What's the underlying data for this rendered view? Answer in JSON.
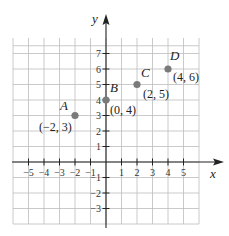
{
  "chart_data": {
    "type": "scatter",
    "title": "",
    "xlabel": "x",
    "ylabel": "y",
    "xlim": [
      -6,
      6
    ],
    "ylim": [
      -4,
      8
    ],
    "grid": true,
    "x_ticks": [
      -5,
      -4,
      -3,
      -2,
      -1,
      1,
      2,
      3,
      4,
      5
    ],
    "y_ticks": [
      -3,
      -2,
      -1,
      1,
      2,
      3,
      4,
      5,
      6,
      7
    ],
    "x_tick_labels": [
      "−5",
      "−4",
      "−3",
      "−2",
      "−1",
      "1",
      "2",
      "3",
      "4",
      "5"
    ],
    "y_tick_labels": [
      "−3",
      "−2",
      "−1",
      "1",
      "2",
      "3",
      "4",
      "5",
      "6",
      "7"
    ],
    "points": [
      {
        "name": "A",
        "x": -2,
        "y": 3,
        "label": "(−2, 3)"
      },
      {
        "name": "B",
        "x": 0,
        "y": 4,
        "label": "(0, 4)"
      },
      {
        "name": "C",
        "x": 2,
        "y": 5,
        "label": "(2, 5)"
      },
      {
        "name": "D",
        "x": 4,
        "y": 6,
        "label": "(4, 6)"
      }
    ],
    "point_color": "#7a7a7a"
  }
}
